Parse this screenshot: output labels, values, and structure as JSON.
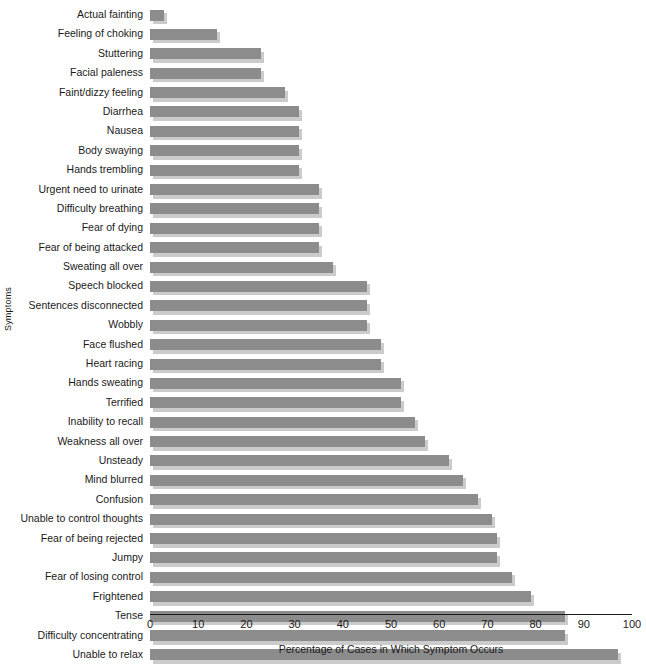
{
  "chart_data": {
    "type": "bar",
    "orientation": "horizontal",
    "title": "",
    "xlabel": "Percentage of Cases in Which Symptom Occurs",
    "ylabel": "Symptoms",
    "xlim": [
      0,
      100
    ],
    "xticks": [
      0,
      10,
      20,
      30,
      40,
      50,
      60,
      70,
      80,
      90,
      100
    ],
    "grid": false,
    "legend": "none",
    "bar_color": "#8c8c8c",
    "shadow_color": "#cbcbcb",
    "categories": [
      "Actual fainting",
      "Feeling of choking",
      "Stuttering",
      "Facial paleness",
      "Faint/dizzy feeling",
      "Diarrhea",
      "Nausea",
      "Body swaying",
      "Hands trembling",
      "Urgent need to urinate",
      "Difficulty breathing",
      "Fear of dying",
      "Fear of being attacked",
      "Sweating all over",
      "Speech blocked",
      "Sentences disconnected",
      "Wobbly",
      "Face flushed",
      "Heart racing",
      "Hands sweating",
      "Terrified",
      "Inability to recall",
      "Weakness all over",
      "Unsteady",
      "Mind blurred",
      "Confusion",
      "Unable to control thoughts",
      "Fear of being rejected",
      "Jumpy",
      "Fear of losing control",
      "Frightened",
      "Tense",
      "Difficulty concentrating",
      "Unable to relax"
    ],
    "values": [
      3,
      14,
      23,
      23,
      28,
      31,
      31,
      31,
      31,
      35,
      35,
      35,
      35,
      38,
      45,
      45,
      45,
      48,
      48,
      52,
      52,
      55,
      57,
      62,
      65,
      68,
      71,
      72,
      72,
      75,
      79,
      86,
      86,
      97
    ]
  }
}
